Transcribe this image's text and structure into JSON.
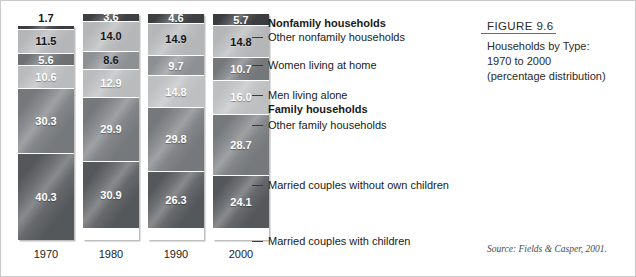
{
  "figure": {
    "title": "FIGURE 9.6",
    "lines": [
      "Households by Type:",
      "1970 to 2000",
      "(percentage distribution)"
    ]
  },
  "source": "Source: Fields & Casper, 2001.",
  "callouts": [
    {
      "text": "Nonfamily households",
      "type": "head"
    },
    {
      "text": "Other nonfamily households",
      "type": "item"
    },
    {
      "text": "Women living at home",
      "type": "item"
    },
    {
      "text": "Men living alone",
      "type": "item"
    },
    {
      "text": "Family households",
      "type": "head"
    },
    {
      "text": "Other family households",
      "type": "item"
    },
    {
      "text": "Married couples without own children",
      "type": "item"
    },
    {
      "text": "Married couples with children",
      "type": "item"
    }
  ],
  "chart_data": {
    "type": "bar",
    "title": "Households by Type: 1970 to 2000 (percentage distribution)",
    "xlabel": "",
    "ylabel": "",
    "ylim": [
      0,
      100
    ],
    "stacked": true,
    "grid": false,
    "legend_position": "right-callouts",
    "categories": [
      "1970",
      "1980",
      "1990",
      "2000"
    ],
    "series": [
      {
        "name": "Married couples with children",
        "values": [
          40.3,
          30.9,
          26.3,
          24.1
        ]
      },
      {
        "name": "Married couples without own children",
        "values": [
          30.3,
          29.9,
          29.8,
          28.7
        ]
      },
      {
        "name": "Other family households",
        "values": [
          10.6,
          12.9,
          14.8,
          16.0
        ]
      },
      {
        "name": "Men living alone",
        "values": [
          5.6,
          8.6,
          9.7,
          10.7
        ]
      },
      {
        "name": "Women living at home",
        "values": [
          11.5,
          14.0,
          14.9,
          14.8
        ]
      },
      {
        "name": "Other nonfamily households",
        "values": [
          1.7,
          3.6,
          4.6,
          5.7
        ]
      }
    ]
  },
  "columns": [
    {
      "year": "1970",
      "cap_label": "1.7",
      "segments": [
        {
          "value": "1.7",
          "shade": "dark",
          "tone": "#3a3c3f",
          "external": true
        },
        {
          "value": "11.5",
          "shade": "dark",
          "tone": "#b4b6b8"
        },
        {
          "value": "5.6",
          "shade": "light",
          "tone": "#6e7174"
        },
        {
          "value": "10.6",
          "shade": "light",
          "tone": "#b9bbbd"
        },
        {
          "value": "30.3",
          "shade": "light",
          "tone": "#76797c"
        },
        {
          "value": "40.3",
          "shade": "light",
          "tone": "#55585b"
        }
      ]
    },
    {
      "year": "1980",
      "cap_label": "",
      "segments": [
        {
          "value": "3.6",
          "shade": "light",
          "tone": "#3d3f42"
        },
        {
          "value": "14.0",
          "shade": "dark",
          "tone": "#b4b6b8"
        },
        {
          "value": "8.6",
          "shade": "dark",
          "tone": "#8e9194"
        },
        {
          "value": "12.9",
          "shade": "light",
          "tone": "#b9bbbd"
        },
        {
          "value": "29.9",
          "shade": "light",
          "tone": "#76797c"
        },
        {
          "value": "30.9",
          "shade": "light",
          "tone": "#55585b"
        }
      ]
    },
    {
      "year": "1990",
      "cap_label": "",
      "segments": [
        {
          "value": "4.6",
          "shade": "light",
          "tone": "#3d3f42"
        },
        {
          "value": "14.9",
          "shade": "dark",
          "tone": "#b4b6b8"
        },
        {
          "value": "9.7",
          "shade": "light",
          "tone": "#8e9194"
        },
        {
          "value": "14.8",
          "shade": "light",
          "tone": "#bdbfc1"
        },
        {
          "value": "29.8",
          "shade": "light",
          "tone": "#76797c"
        },
        {
          "value": "26.3",
          "shade": "light",
          "tone": "#55585b"
        }
      ]
    },
    {
      "year": "2000",
      "cap_label": "",
      "segments": [
        {
          "value": "5.7",
          "shade": "light",
          "tone": "#3a3c3f"
        },
        {
          "value": "14.8",
          "shade": "dark",
          "tone": "#b4b6b8"
        },
        {
          "value": "10.7",
          "shade": "light",
          "tone": "#75787b"
        },
        {
          "value": "16.0",
          "shade": "light",
          "tone": "#bdbfc1"
        },
        {
          "value": "28.7",
          "shade": "light",
          "tone": "#76797c"
        },
        {
          "value": "24.1",
          "shade": "light",
          "tone": "#55585b"
        }
      ]
    }
  ]
}
